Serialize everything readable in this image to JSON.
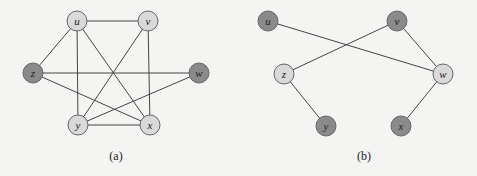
{
  "colors": {
    "light": "#d9d9d9",
    "dark": "#8a8a8a",
    "edge": "#444444",
    "stroke": "#666666"
  },
  "graphs": [
    {
      "caption": "(a)",
      "caption_pos": [
        116,
        160
      ],
      "nodes": [
        {
          "id": "u",
          "x": 77,
          "y": 21,
          "shade": "light"
        },
        {
          "id": "v",
          "x": 148,
          "y": 21,
          "shade": "light"
        },
        {
          "id": "z",
          "x": 33,
          "y": 73,
          "shade": "dark"
        },
        {
          "id": "w",
          "x": 199,
          "y": 73,
          "shade": "dark"
        },
        {
          "id": "y",
          "x": 78,
          "y": 125,
          "shade": "light"
        },
        {
          "id": "x",
          "x": 150,
          "y": 125,
          "shade": "light"
        }
      ],
      "edges": [
        [
          "u",
          "v"
        ],
        [
          "u",
          "z"
        ],
        [
          "u",
          "y"
        ],
        [
          "u",
          "x"
        ],
        [
          "v",
          "y"
        ],
        [
          "v",
          "x"
        ],
        [
          "z",
          "w"
        ],
        [
          "z",
          "x"
        ],
        [
          "w",
          "y"
        ],
        [
          "y",
          "x"
        ]
      ]
    },
    {
      "caption": "(b)",
      "caption_pos": [
        364,
        160
      ],
      "nodes": [
        {
          "id": "u",
          "x": 268,
          "y": 21,
          "shade": "dark"
        },
        {
          "id": "v",
          "x": 397,
          "y": 21,
          "shade": "dark"
        },
        {
          "id": "z",
          "x": 284,
          "y": 74,
          "shade": "light"
        },
        {
          "id": "w",
          "x": 443,
          "y": 74,
          "shade": "light"
        },
        {
          "id": "y",
          "x": 326,
          "y": 126,
          "shade": "dark"
        },
        {
          "id": "x",
          "x": 401,
          "y": 126,
          "shade": "dark"
        }
      ],
      "edges": [
        [
          "u",
          "w"
        ],
        [
          "v",
          "z"
        ],
        [
          "v",
          "w"
        ],
        [
          "z",
          "y"
        ],
        [
          "w",
          "x"
        ]
      ]
    }
  ]
}
